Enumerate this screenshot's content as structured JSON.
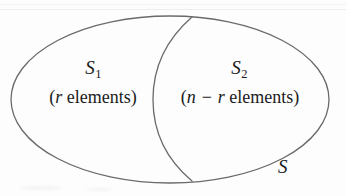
{
  "figure": {
    "type": "venn-partition-diagram",
    "width": 346,
    "height": 196,
    "background_color": "#fdfdfd",
    "stroke_color": "#6a6a6a",
    "text_color": "#1b1b1b"
  },
  "regions": {
    "left": {
      "set_label": "S",
      "set_subscript": "1",
      "count_open_paren": "(",
      "count_variable": "r",
      "count_word": "elements",
      "count_close_paren": ")",
      "count_full": "(r elements)"
    },
    "right": {
      "set_label": "S",
      "set_subscript": "2",
      "count_open_paren": "(",
      "count_variable_first": "n",
      "count_operator": "−",
      "count_variable_second": "r",
      "count_word": "elements",
      "count_close_paren": ")",
      "count_full": "(n − r elements)"
    }
  },
  "universe": {
    "label": "S"
  },
  "geometry": {
    "outer_ellipse": {
      "center_x": 170,
      "center_y": 99.5,
      "radius_x": 159,
      "radius_y": 83.5,
      "stroke_width": 1.3
    },
    "divider_arc": {
      "top_x": 192,
      "top_y": 17,
      "bottom_x": 192,
      "bottom_y": 181,
      "bulge_left_x": 153,
      "stroke_width": 1.3
    }
  }
}
